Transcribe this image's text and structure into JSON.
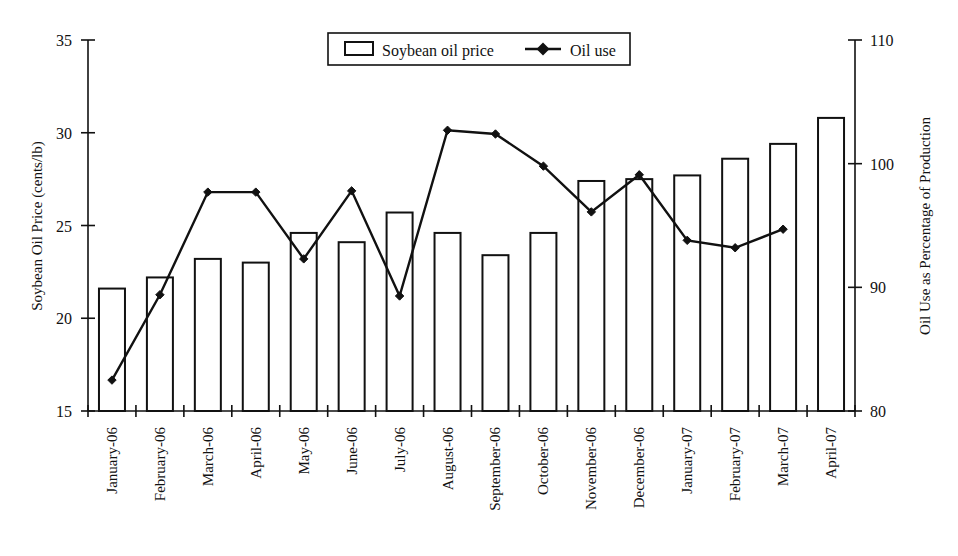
{
  "chart_data": {
    "type": "bar",
    "title": "",
    "subtitle": "",
    "xlabel": "",
    "ylabel": "Soybean Oil Price (cents/lb)",
    "y2label": "Oil Use as Percentage of Production",
    "ylim": [
      15,
      35
    ],
    "y2lim": [
      80,
      110
    ],
    "yticks": [
      "15",
      "20",
      "25",
      "30",
      "35"
    ],
    "ytick_values": [
      15,
      20,
      25,
      30,
      35
    ],
    "y2ticks": [
      "80",
      "90",
      "100",
      "110"
    ],
    "y2tick_values": [
      80,
      90,
      100,
      110
    ],
    "grid": false,
    "legend_position": "top-center",
    "categories": [
      "January-06",
      "February-06",
      "March-06",
      "April-06",
      "May-06",
      "June-06",
      "July-06",
      "August-06",
      "September-06",
      "October-06",
      "November-06",
      "December-06",
      "January-07",
      "February-07",
      "March-07",
      "April-07"
    ],
    "series": [
      {
        "name": "Soybean oil price",
        "type": "bar",
        "axis": "left",
        "unit": "cents/lb",
        "values": [
          21.6,
          22.2,
          23.2,
          23.0,
          24.6,
          24.1,
          25.7,
          24.6,
          23.4,
          24.6,
          27.4,
          27.5,
          27.7,
          28.6,
          29.4,
          30.8
        ]
      },
      {
        "name": "Oil use",
        "type": "line",
        "axis": "right",
        "unit": "percent of production",
        "values": [
          82.5,
          89.4,
          97.7,
          97.7,
          92.3,
          97.8,
          89.3,
          102.7,
          102.4,
          99.8,
          96.1,
          99.1,
          93.8,
          93.2,
          94.7,
          null
        ]
      }
    ]
  },
  "legend": {
    "items": [
      {
        "label": "Soybean oil price",
        "marker": "open-rect-swatch"
      },
      {
        "label": "Oil use",
        "marker": "line-with-diamond-marker"
      }
    ]
  },
  "colors": {
    "ink": "#111111",
    "background": "#ffffff",
    "bar_fill": "#ffffff"
  }
}
